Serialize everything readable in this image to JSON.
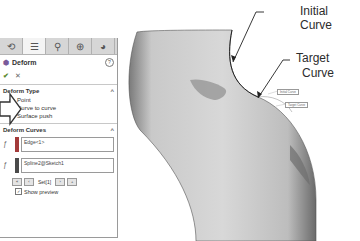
{
  "annotations": {
    "initial_curve": "Initial Curve",
    "target_curve_line1": "Target",
    "target_curve_line2": "Curve"
  },
  "viewport_tags": {
    "initial": "Initial Curve",
    "target": "Target Curve"
  },
  "property_manager": {
    "tabs": [
      {
        "icon": "feature-manager-icon"
      },
      {
        "icon": "property-manager-icon",
        "active": true
      },
      {
        "icon": "configuration-manager-icon"
      },
      {
        "icon": "dimxpert-icon"
      },
      {
        "icon": "display-manager-icon"
      }
    ],
    "title": "Deform",
    "help_label": "?",
    "ok_glyph": "✔",
    "cancel_glyph": "✕",
    "deform_type": {
      "label": "Deform Type",
      "options": [
        "Point",
        "Curve to curve",
        "Surface push"
      ],
      "selected": "Curve to curve"
    },
    "deform_curves": {
      "label": "Deform Curves",
      "initial_field": "Edge<1>",
      "target_field": "Spline2@Sketch1",
      "set_label": "Set[1]",
      "initial_color": "#a33a3a",
      "target_color": "#4a4a4a"
    },
    "show_preview_label": "Show preview",
    "show_preview_checked": true
  }
}
